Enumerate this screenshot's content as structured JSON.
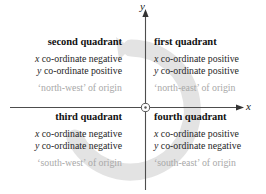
{
  "diagram": {
    "axes": {
      "y_label": "y",
      "x_label": "x",
      "origin_marker": "origin-circle"
    },
    "colors": {
      "axis": "#4d4d4d",
      "heading_text": "#111111",
      "body_text": "#262626",
      "muted_text": "#a8a8a8",
      "watermark": "#e2e2e2",
      "background": "#ffffff"
    },
    "quadrants": [
      {
        "id": "second",
        "title": "second quadrant",
        "x_var": "x",
        "x_rule": " co-ordinate negative",
        "y_var": "y",
        "y_rule": " co-ordinate positive",
        "direction": "‘north-west’ of origin"
      },
      {
        "id": "first",
        "title": "first quadrant",
        "x_var": "x",
        "x_rule": " co-ordinate positive",
        "y_var": "y",
        "y_rule": " co-ordinate positive",
        "direction": "‘north-east’ of origin"
      },
      {
        "id": "third",
        "title": "third quadrant",
        "x_var": "x",
        "x_rule": " co-ordinate negative",
        "y_var": "y",
        "y_rule": " co-ordinate negative",
        "direction": "‘south-west’ of origin"
      },
      {
        "id": "fourth",
        "title": "fourth quadrant",
        "x_var": "x",
        "x_rule": " co-ordinate positive",
        "y_var": "y",
        "y_rule": " co-ordinate negative",
        "direction": "‘south-east’ of origin"
      }
    ]
  }
}
